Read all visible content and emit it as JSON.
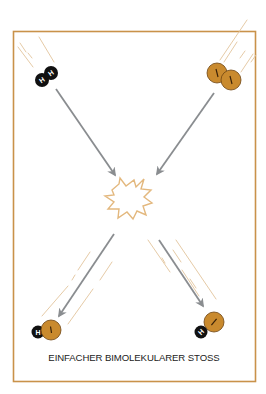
{
  "diagram": {
    "title": "EINFACHER BIMOLEKULARER STOSS",
    "colors": {
      "frame": "#c9924a",
      "hydrogen": "#111111",
      "iodine": "#c98a2e",
      "iodine_outline": "#6e4513",
      "arrow": "#8a8d90",
      "burst": "#e3b87e",
      "speed_lines": "#e2c49c",
      "caption": "#222222"
    },
    "reactants": [
      {
        "name": "H2",
        "atoms": [
          {
            "symbol": "H",
            "label": "H"
          },
          {
            "symbol": "H",
            "label": "H"
          }
        ]
      },
      {
        "name": "I2",
        "atoms": [
          {
            "symbol": "I",
            "label": "I"
          },
          {
            "symbol": "I",
            "label": "I"
          }
        ]
      }
    ],
    "products": [
      {
        "name": "HI",
        "atoms": [
          {
            "symbol": "H",
            "label": "H"
          },
          {
            "symbol": "I",
            "label": "I"
          }
        ]
      },
      {
        "name": "HI",
        "atoms": [
          {
            "symbol": "H",
            "label": "H"
          },
          {
            "symbol": "I",
            "label": "I"
          }
        ]
      }
    ],
    "collision_marker": "burst"
  }
}
